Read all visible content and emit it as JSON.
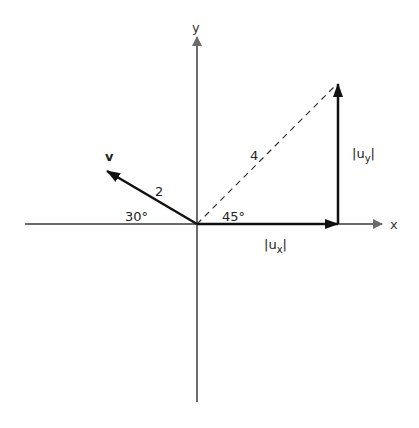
{
  "diagram": {
    "type": "vector-components",
    "colors": {
      "axis": "#6b6b6b",
      "vector": "#111111",
      "dashed": "#333333",
      "background": "#ffffff"
    },
    "axes": {
      "x_label": "x",
      "y_label": "y"
    },
    "vectors": {
      "v": {
        "label": "v",
        "magnitude_label": "2",
        "angle_label": "30°"
      },
      "u": {
        "magnitude_label": "4",
        "angle_label": "45°"
      },
      "ux": {
        "label_base": "|u",
        "label_sub": "x",
        "label_end": "|"
      },
      "uy": {
        "label_base": "|u",
        "label_sub": "y",
        "label_end": "|"
      }
    }
  }
}
